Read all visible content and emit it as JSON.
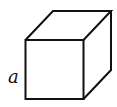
{
  "diagram": {
    "type": "cube",
    "edge_label": "a",
    "stroke_color": "#111111",
    "background": "#ffffff"
  }
}
